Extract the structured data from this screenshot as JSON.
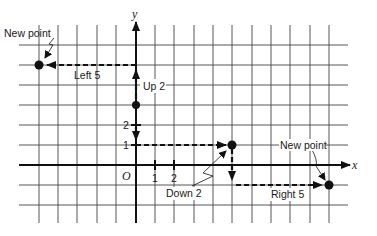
{
  "diagram": {
    "axes": {
      "x_label": "x",
      "y_label": "y",
      "origin_label": "O",
      "x_ticks": [
        "1",
        "2"
      ],
      "y_ticks": [
        "1",
        "2"
      ]
    },
    "grid": {
      "x_range": [
        -5,
        10
      ],
      "y_range": [
        -3,
        7
      ]
    },
    "points": [
      {
        "name": "start-left",
        "coords": [
          0,
          3
        ]
      },
      {
        "name": "new-point-left",
        "coords": [
          -5,
          5
        ]
      },
      {
        "name": "start-right",
        "coords": [
          5,
          1
        ]
      },
      {
        "name": "new-point-right",
        "coords": [
          10,
          -1
        ]
      }
    ],
    "labels": {
      "new_point_left": "New point",
      "left_5": "Left 5",
      "up_2": "Up 2",
      "new_point_right": "New point",
      "down_2": "Down 2",
      "right_5": "Right 5"
    },
    "colors": {
      "grid": "#333333",
      "ink": "#111111",
      "background": "#ffffff"
    }
  }
}
